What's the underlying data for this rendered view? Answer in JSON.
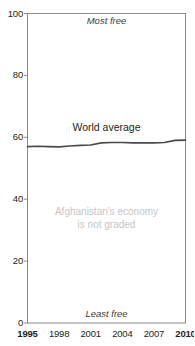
{
  "chart_data": {
    "type": "line",
    "title": "Economic freedom",
    "xlabel": "",
    "ylabel": "",
    "xlim": [
      1995,
      2010
    ],
    "ylim": [
      0,
      100
    ],
    "grid": false,
    "legend_position": "inline-label",
    "x_tick_labels": [
      "1995",
      "1998",
      "2001",
      "2004",
      "2007",
      "2010"
    ],
    "x_tick_values": [
      1995,
      1998,
      2001,
      2004,
      2007,
      2010
    ],
    "x_tick_bold": [
      true,
      false,
      false,
      false,
      false,
      true
    ],
    "y_tick_labels": [
      "0",
      "20",
      "40",
      "60",
      "80",
      "100"
    ],
    "y_tick_values": [
      0,
      20,
      40,
      60,
      80,
      100
    ],
    "series": [
      {
        "name": "World average",
        "color": "#4a4a4a",
        "x": [
          1995,
          1996,
          1997,
          1998,
          1999,
          2000,
          2001,
          2002,
          2003,
          2004,
          2005,
          2006,
          2007,
          2008,
          2009,
          2010
        ],
        "values": [
          57.0,
          57.1,
          57.0,
          56.9,
          57.2,
          57.4,
          57.5,
          58.2,
          58.3,
          58.3,
          58.2,
          58.2,
          58.2,
          58.3,
          59.0,
          59.1
        ]
      }
    ],
    "annotations": [
      {
        "id": "most-free",
        "text": "Most free",
        "position": "top-center",
        "style": "italic"
      },
      {
        "id": "least-free",
        "text": "Least free",
        "position": "bottom-center",
        "style": "italic"
      },
      {
        "id": "series-label",
        "text": "World average",
        "position": "above-line",
        "style": "plain"
      },
      {
        "id": "not-graded-line1",
        "text": "Afghanistan's economy",
        "position": "center",
        "style": "muted"
      },
      {
        "id": "not-graded-line2",
        "text": "is not graded",
        "position": "center",
        "style": "muted"
      }
    ],
    "colors": {
      "line": "#4a4a4a",
      "axis": "#8a8a8a",
      "text": "#231f20",
      "muted_text": "#c6c6c6",
      "background": "#ffffff"
    }
  }
}
